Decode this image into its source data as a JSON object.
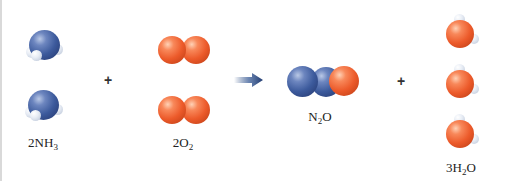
{
  "diagram": {
    "type": "chemical-reaction",
    "reactants": [
      {
        "coefficient": "2",
        "formula_main": "NH",
        "formula_sub": "3",
        "trailing": "",
        "count": 2,
        "atoms": [
          "N",
          "H",
          "H",
          "H"
        ]
      },
      {
        "coefficient": "2",
        "formula_main": "O",
        "formula_sub": "2",
        "trailing": "",
        "count": 2,
        "atoms": [
          "O",
          "O"
        ]
      }
    ],
    "products": [
      {
        "coefficient": "",
        "formula_main": "N",
        "formula_sub": "2",
        "trailing": "O",
        "count": 1,
        "atoms": [
          "N",
          "N",
          "O"
        ]
      },
      {
        "coefficient": "3",
        "formula_main": "H",
        "formula_sub": "2",
        "trailing": "O",
        "count": 3,
        "atoms": [
          "H",
          "H",
          "O"
        ]
      }
    ],
    "operators": {
      "plus_left": "+",
      "plus_right": "+",
      "arrow": "reaction-arrow"
    },
    "labels": {
      "nh3": {
        "pre": "2NH",
        "sub": "3",
        "post": ""
      },
      "o2": {
        "pre": "2O",
        "sub": "2",
        "post": ""
      },
      "n2o": {
        "pre": "N",
        "sub": "2",
        "post": "O"
      },
      "h2o": {
        "pre": "3H",
        "sub": "2",
        "post": "O"
      }
    },
    "colors": {
      "nitrogen": "#3c5a9c",
      "oxygen": "#ec5a2a",
      "hydrogen": "#e8edf5",
      "arrow": "#2a4a80"
    }
  }
}
